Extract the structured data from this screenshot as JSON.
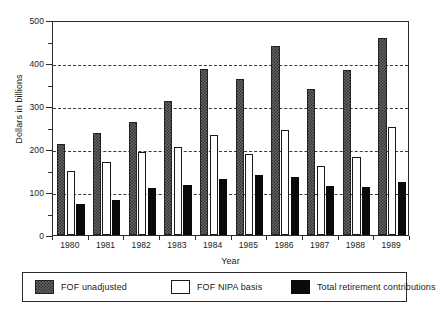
{
  "chart_data": {
    "type": "bar",
    "title": "",
    "xlabel": "Year",
    "ylabel": "Dollars in billions",
    "categories": [
      "1980",
      "1981",
      "1982",
      "1983",
      "1984",
      "1985",
      "1986",
      "1987",
      "1988",
      "1989"
    ],
    "series": [
      {
        "name": "FOF unadjusted",
        "swatch": "checkered-gray",
        "color": "#646464",
        "values": [
          212,
          238,
          262,
          311,
          386,
          363,
          440,
          340,
          384,
          458
        ]
      },
      {
        "name": "FOF NIPA basis",
        "swatch": "white-outline",
        "color": "#ffffff",
        "values": [
          150,
          170,
          193,
          205,
          233,
          188,
          245,
          161,
          181,
          252
        ]
      },
      {
        "name": "Total retirement contributions",
        "swatch": "solid-black",
        "color": "#0a0a0a",
        "values": [
          73,
          82,
          110,
          117,
          130,
          140,
          135,
          113,
          112,
          124
        ]
      }
    ],
    "ylim": [
      0,
      500
    ],
    "ytick_major": [
      0,
      100,
      200,
      300,
      400,
      500
    ],
    "ytick_minor": [
      50,
      150,
      250,
      350,
      450
    ],
    "ytick_labels": [
      "0",
      "100",
      "200",
      "300",
      "400",
      "500"
    ],
    "grid": true,
    "gridlines_at": [
      100,
      200,
      300,
      400
    ],
    "grid_style": "dashed",
    "legend_position": "bottom"
  },
  "axes": {
    "y_title": "Dollars in billions",
    "x_title": "Year"
  },
  "legend": {
    "entries": [
      {
        "label": "FOF unadjusted"
      },
      {
        "label": "FOF NIPA basis"
      },
      {
        "label": "Total retirement contributions"
      }
    ]
  }
}
